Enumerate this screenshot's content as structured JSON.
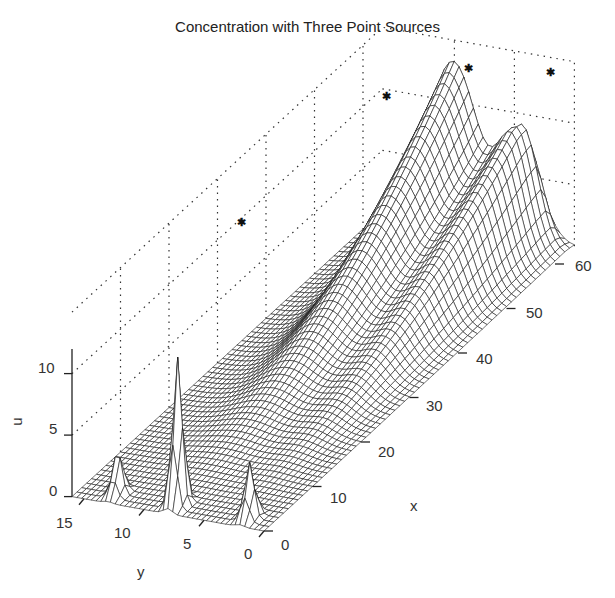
{
  "chart_data": {
    "type": "surface",
    "title": "Concentration with Three Point Sources",
    "xlabel": "x",
    "ylabel": "y",
    "zlabel": "u",
    "x_ticks": [
      "0",
      "10",
      "20",
      "30",
      "40",
      "50",
      "60"
    ],
    "y_ticks": [
      "0",
      "5",
      "10",
      "15"
    ],
    "z_ticks": [
      "0",
      "5",
      "10"
    ],
    "xlim": [
      0,
      64
    ],
    "ylim": [
      0,
      16
    ],
    "zlim": [
      0,
      12
    ],
    "grid": true,
    "sources": [
      {
        "x": 2,
        "y": 13,
        "peak_u": 3.5,
        "label": "source-1"
      },
      {
        "x": 2,
        "y": 8,
        "peak_u": 12,
        "label": "source-2"
      },
      {
        "x": 2,
        "y": 2,
        "peak_u": 4.5,
        "label": "source-3"
      }
    ],
    "plumes": [
      {
        "center_y": 8.5,
        "peak_x": 60,
        "peak_u": 15,
        "note": "large ridge from central source"
      },
      {
        "center_y": 3.5,
        "peak_x": 62,
        "peak_u": 9.5,
        "note": "smaller ridge"
      }
    ],
    "markers": [
      {
        "x": 30,
        "y": 14,
        "u": 12,
        "symbol": "*"
      },
      {
        "x": 55,
        "y": 12,
        "u": 13.5,
        "symbol": "*"
      },
      {
        "x": 62,
        "y": 8,
        "u": 14,
        "symbol": "*"
      },
      {
        "x": 64,
        "y": 2,
        "u": 14,
        "symbol": "*"
      }
    ]
  }
}
